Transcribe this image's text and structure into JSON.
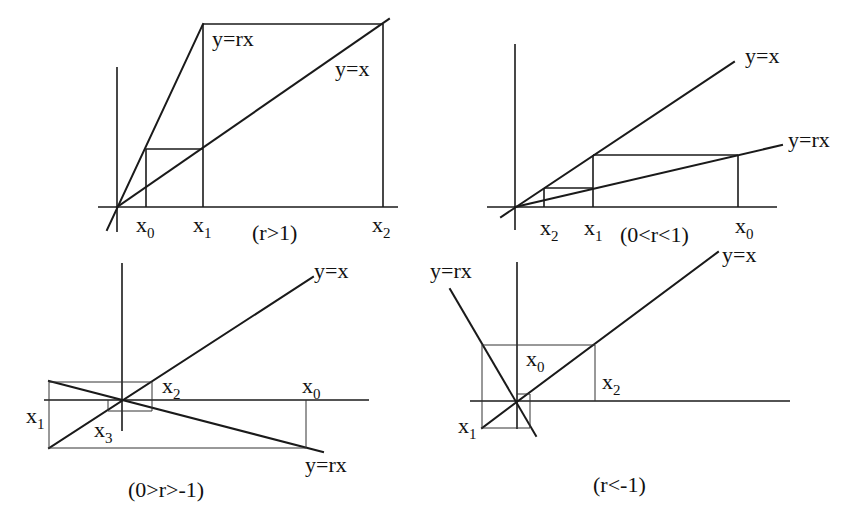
{
  "figure": {
    "colors": {
      "ink": "#1a1a1a",
      "background": "#ffffff"
    }
  },
  "panels": [
    {
      "id": "r-gt-1",
      "caption": "(r>1)",
      "line_labels": {
        "identity": "y=x",
        "map": "y=rx"
      },
      "iterate_labels": [
        {
          "base": "x",
          "sub": "0"
        },
        {
          "base": "x",
          "sub": "1"
        },
        {
          "base": "x",
          "sub": "2"
        }
      ],
      "behavior": "monotone divergence"
    },
    {
      "id": "0-lt-r-lt-1",
      "caption": "(0<r<1)",
      "line_labels": {
        "identity": "y=x",
        "map": "y=rx"
      },
      "iterate_labels": [
        {
          "base": "x",
          "sub": "2"
        },
        {
          "base": "x",
          "sub": "1"
        },
        {
          "base": "x",
          "sub": "0"
        }
      ],
      "behavior": "monotone convergence"
    },
    {
      "id": "minus1-lt-r-lt-0",
      "caption": "(0>r>-1)",
      "line_labels": {
        "identity": "y=x",
        "map": "y=rx"
      },
      "iterate_labels": [
        {
          "base": "x",
          "sub": "1"
        },
        {
          "base": "x",
          "sub": "3"
        },
        {
          "base": "x",
          "sub": "2"
        },
        {
          "base": "x",
          "sub": "0"
        }
      ],
      "behavior": "oscillating convergence"
    },
    {
      "id": "r-lt-minus1",
      "caption": "(r<-1)",
      "line_labels": {
        "identity": "y=x",
        "map": "y=rx"
      },
      "iterate_labels": [
        {
          "base": "x",
          "sub": "0"
        },
        {
          "base": "x",
          "sub": "2"
        },
        {
          "base": "x",
          "sub": "1"
        }
      ],
      "behavior": "oscillating divergence"
    }
  ]
}
